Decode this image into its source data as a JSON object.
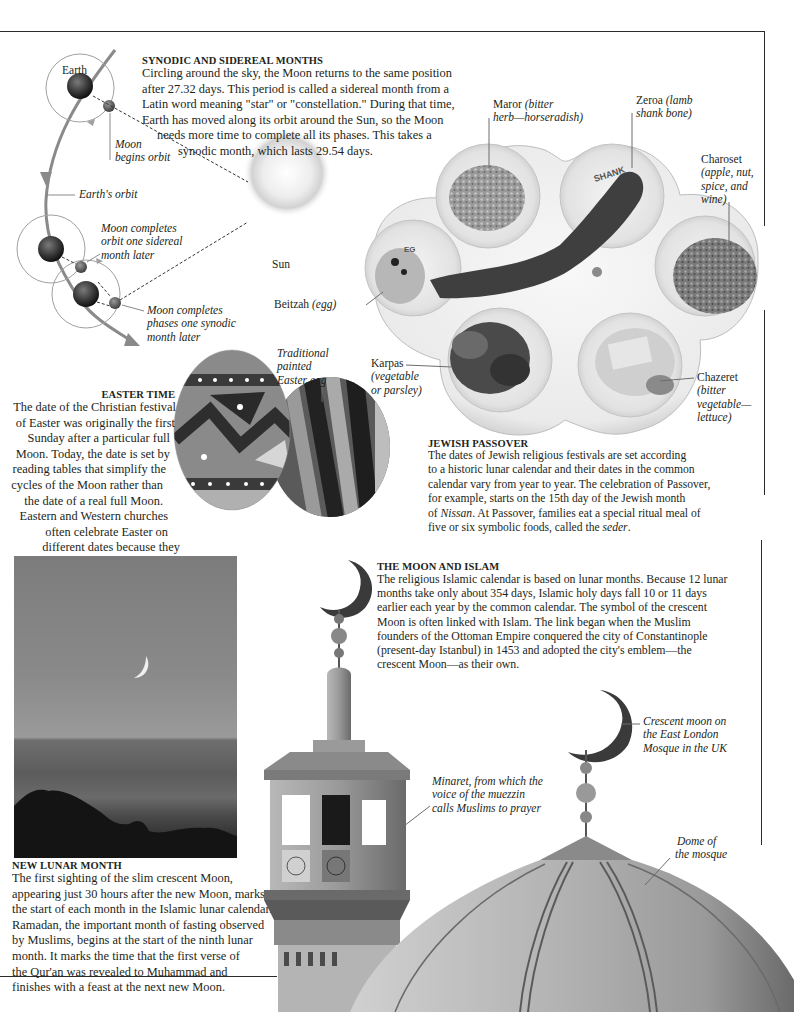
{
  "page": {
    "accent_colors": {
      "rule": "#2a2a2a",
      "orbit_line": "#8a8a8a",
      "text": "#231f20",
      "sky_photo": "#8c8c8c"
    }
  },
  "synodic_section": {
    "heading": "SYNODIC AND SIDEREAL MONTHS",
    "body_lines": [
      "Circling around the sky, the Moon returns to the same position",
      "after 27.32 days. This period is called a sidereal month from a",
      "Latin word meaning \"star\" or \"constellation.\" During that time,",
      "Earth has moved along its orbit around the Sun, so the Moon",
      "needs more time to complete all its phases. This takes a",
      "synodic month, which lasts 29.54 days."
    ],
    "diagram_labels": {
      "earth": "Earth",
      "moon_begins_1": "Moon",
      "moon_begins_2": "begins orbit",
      "earths_orbit": "Earth's orbit",
      "sidereal_1": "Moon completes",
      "sidereal_2": "orbit one sidereal",
      "sidereal_3": "month later",
      "synodic_1": "Moon completes",
      "synodic_2": "phases one synodic",
      "synodic_3": "month later",
      "sun": "Sun"
    }
  },
  "passover_plate": {
    "labels": {
      "maror_name": "Maror ",
      "maror_desc_1": "(bitter",
      "maror_desc_2": "herb—horseradish)",
      "zeroa_name": "Zeroa ",
      "zeroa_desc_1": "(lamb",
      "zeroa_desc_2": "shank bone)",
      "charoset_name": "Charoset",
      "charoset_desc_1": "(apple, nut,",
      "charoset_desc_2": "spice, and",
      "charoset_desc_3": "wine)",
      "beitzah_name": "Beitzah ",
      "beitzah_desc": "(egg)",
      "karpas_name": "Karpas",
      "karpas_desc_1": "(vegetable",
      "karpas_desc_2": "or parsley)",
      "chazeret_name": "Chazeret",
      "chazeret_desc_1": "(bitter",
      "chazeret_desc_2": "vegetable—",
      "chazeret_desc_3": "lettuce)",
      "plate_inscription_shank": "SHANK",
      "plate_inscription_egg": "EG"
    }
  },
  "passover_section": {
    "heading": "JEWISH PASSOVER",
    "body_lines": [
      "The dates of Jewish religious festivals are set according",
      "to a historic lunar calendar and their dates in the common",
      "calendar vary from year to year. The celebration of Passover,",
      "for example, starts on the 15th day of the Jewish month",
      "of ",
      "Nissan",
      ". At Passover, families eat a special ritual meal of",
      "five or six symbolic foods, called the ",
      "seder",
      "."
    ]
  },
  "easter_section": {
    "egg_label_1": "Traditional",
    "egg_label_2": "painted",
    "egg_label_3": "Easter egg",
    "heading": "EASTER TIME",
    "body_lines": [
      "The date of the Christian festival",
      "of Easter was originally the first",
      "Sunday after a particular full",
      "Moon. Today, the date is set by",
      "reading tables that simplify the",
      "cycles of the Moon rather than",
      "the date of a real full Moon.",
      "Eastern and Western churches",
      "often celebrate Easter on",
      "different dates because they",
      "use different calendars."
    ]
  },
  "islam_section": {
    "heading": "THE MOON AND ISLAM",
    "body_lines": [
      "The religious Islamic calendar is based on lunar months. Because 12 lunar",
      "months take only about 354 days, Islamic holy days fall 10 or 11 days",
      "earlier each year by the common calendar. The symbol of the crescent",
      "Moon is often linked with Islam. The link began when the Muslim",
      "founders of the Ottoman Empire conquered the city of Constantinople",
      "(present-day Istanbul) in 1453 and adopted the city's emblem—the",
      "crescent Moon—as their own."
    ],
    "labels": {
      "crescent_1": "Crescent moon on",
      "crescent_2": "the East London",
      "crescent_3": "Mosque in the UK",
      "minaret_1": "Minaret, from which the",
      "minaret_2": "voice of the muezzin",
      "minaret_3": "calls Muslims to prayer",
      "dome_1": "Dome of",
      "dome_2": "the mosque"
    }
  },
  "new_month_section": {
    "heading": "NEW LUNAR MONTH",
    "body_lines": [
      "The first sighting of the slim crescent Moon,",
      "appearing just 30 hours after the new Moon, marks",
      "the start of each month in the Islamic lunar calendar.",
      "Ramadan, the important month of fasting observed",
      "by Muslims, begins at the start of the ninth lunar",
      "month. It marks the time that the first verse of",
      "the Qur'an was revealed to Muhammad and",
      "finishes with a feast at the next new Moon."
    ]
  }
}
